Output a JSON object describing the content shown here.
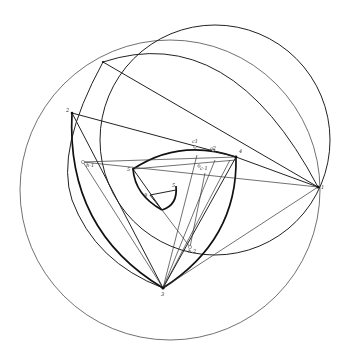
{
  "figure": {
    "points": {
      "p1": {
        "label": "1",
        "x": 318,
        "y": 187
      },
      "p2": {
        "label": "2",
        "x": 72,
        "y": 113
      },
      "p3": {
        "label": "3",
        "x": 163,
        "y": 288
      },
      "p4": {
        "label": "4",
        "x": 236,
        "y": 157
      },
      "p5": {
        "label": "5",
        "x": 133,
        "y": 169
      },
      "p6": {
        "label": "6",
        "x": 103,
        "y": 62
      },
      "inner_a": {
        "label": "5",
        "x": 176,
        "y": 186
      },
      "inner_b": {
        "label": "8",
        "x": 150,
        "y": 195
      }
    },
    "labels": {
      "l1": "1",
      "l2": "2",
      "l3": "3",
      "l4": "4",
      "l5": "5",
      "lh1": "h-1",
      "lh2": "h-2",
      "lc1": "c1",
      "lc2": "c2",
      "lc3": "c-1",
      "l6": "6",
      "l7": "5",
      "l8": "8"
    }
  }
}
